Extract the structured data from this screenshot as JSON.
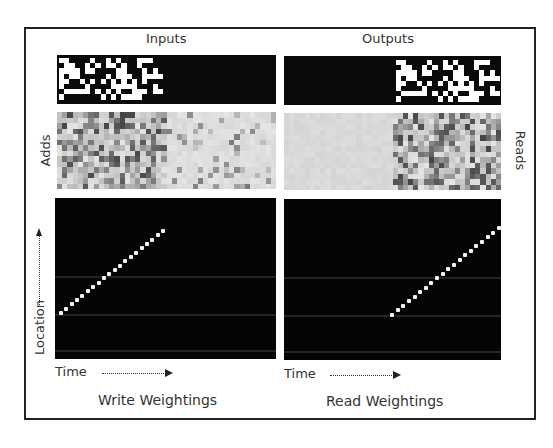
{
  "figure": {
    "titles": {
      "inputs": "Inputs",
      "outputs": "Outputs"
    },
    "side_labels": {
      "left": "Adds",
      "right": "Reads"
    },
    "axis_labels": {
      "location": "Location",
      "time_left": "Time",
      "time_right": "Time"
    },
    "captions": {
      "write": "Write Weightings",
      "read": "Read Weightings"
    },
    "colors": {
      "frame": "#222222",
      "bit_on": "#ffffff",
      "bit_off": "#0a0a0a",
      "adds_bg": "#d9d9d9",
      "weights_bg": "#050505",
      "dot": "#f2f2f2"
    }
  },
  "chart_data": {
    "type": "heatmap",
    "panels": [
      {
        "name": "Inputs",
        "position": "top-left",
        "content": "binary sequence, ~20 time steps x 8 bits, occupying first half of time axis"
      },
      {
        "name": "Outputs",
        "position": "top-right",
        "content": "same binary sequence reproduced in second half of time axis"
      },
      {
        "name": "Adds",
        "position": "middle-left",
        "content": "grayscale add vectors, active in first half"
      },
      {
        "name": "Reads",
        "position": "middle-right",
        "content": "grayscale read vectors, active in second half"
      },
      {
        "name": "Write Weightings",
        "position": "bottom-left",
        "content": "diagonal line of ~20 points rising from lower-left, ending near the middle of time axis",
        "x_label": "Time",
        "y_label": "Location"
      },
      {
        "name": "Read Weightings",
        "position": "bottom-right",
        "content": "diagonal line of ~20 points rising, starting at middle of time axis and ending at right edge",
        "x_label": "Time"
      }
    ],
    "sequence_length": 20,
    "bits_per_step": 8,
    "xlabel": "Time",
    "ylabel": "Location"
  }
}
